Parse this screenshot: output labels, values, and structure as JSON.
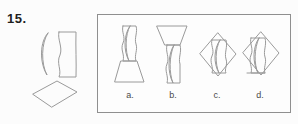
{
  "question": {
    "number_label": "15.",
    "stimulus": {
      "shapes": [
        "crescent-lens",
        "wavy-band",
        "diamond"
      ],
      "description": "Given pieces: a thin crescent lens, a vertical band with wavy left edge, and a wide diamond"
    }
  },
  "options": [
    {
      "id": "a",
      "label": "a.",
      "description": "wavy band with crescent inside, sitting on a trapezoid with wide base"
    },
    {
      "id": "b",
      "label": "b.",
      "description": "trapezoid with wide top above a wavy band with crescent inside"
    },
    {
      "id": "c",
      "label": "c.",
      "description": "diamond overlapped by centered wavy band with crescent inside"
    },
    {
      "id": "d",
      "label": "d.",
      "description": "diamond overlapped by left-shifted wavy band with crescent inside"
    }
  ],
  "colors": {
    "line": "#9a9a9a",
    "box_border": "#8f8f8f",
    "option_label": "#4a4a4a",
    "question_number": "#1f1f1f",
    "background": "#fcfcfc"
  }
}
